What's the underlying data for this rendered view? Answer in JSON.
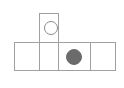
{
  "diagram": {
    "type": "grid-puzzle-shape",
    "shape_name": "t-tetromino-grid",
    "canvas": {
      "width": 124,
      "height": 88,
      "background": "#ffffff"
    },
    "colors": {
      "cell_border": "#a0a0a0",
      "cell_fill": "#ffffff",
      "hollow_token_stroke": "#8c8c8c",
      "filled_token_fill": "#6b6b6b"
    },
    "cells": [
      {
        "name": "top-cell",
        "row": 0,
        "column": 1,
        "x": 39,
        "y": 13,
        "width": 20,
        "height": 30,
        "content": "hollow-circle"
      },
      {
        "name": "bottom-cell-1",
        "row": 1,
        "column": 0,
        "x": 14,
        "y": 42,
        "width": 26,
        "height": 29,
        "content": "empty"
      },
      {
        "name": "bottom-cell-2",
        "row": 1,
        "column": 1,
        "x": 39,
        "y": 42,
        "width": 20,
        "height": 29,
        "content": "empty"
      },
      {
        "name": "bottom-cell-3",
        "row": 1,
        "column": 2,
        "x": 58,
        "y": 42,
        "width": 33,
        "height": 29,
        "content": "filled-circle"
      },
      {
        "name": "bottom-cell-4",
        "row": 1,
        "column": 3,
        "x": 90,
        "y": 42,
        "width": 26,
        "height": 29,
        "content": "empty"
      }
    ],
    "tokens": [
      {
        "name": "hollow-circle-token",
        "style": "hollow",
        "center_x": 51,
        "center_y": 28,
        "radius": 7
      },
      {
        "name": "filled-circle-token",
        "style": "filled",
        "center_x": 74,
        "center_y": 57,
        "radius": 8
      }
    ]
  }
}
